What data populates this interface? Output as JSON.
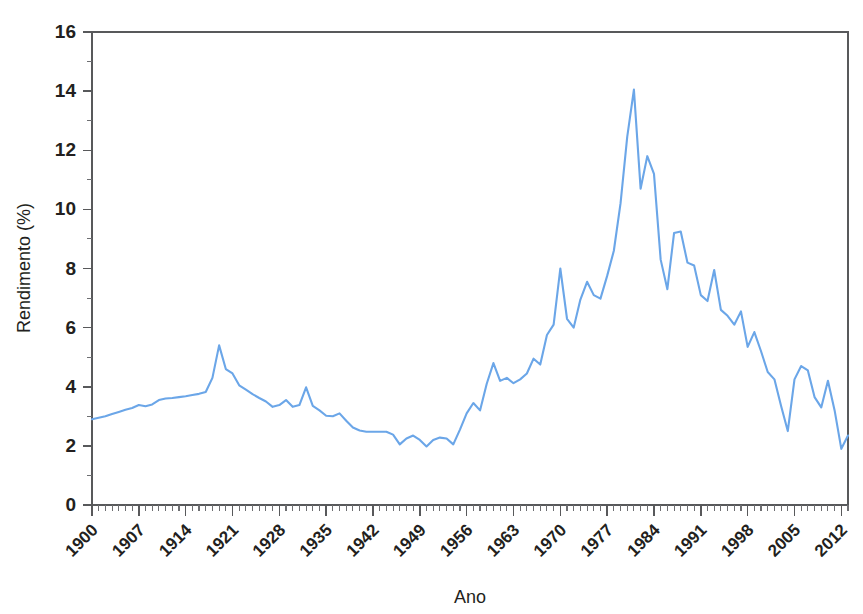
{
  "chart_data": {
    "type": "line",
    "title": "",
    "xlabel": "Ano",
    "ylabel": "Rendimento (%)",
    "xlim": [
      1900,
      2013
    ],
    "ylim": [
      0,
      16
    ],
    "grid": false,
    "legend": false,
    "line_color": "#6ba6e8",
    "axis_color": "#58595b",
    "y_ticks": [
      0,
      2,
      4,
      6,
      8,
      10,
      12,
      14,
      16
    ],
    "y_tick_labels": [
      "0",
      "2",
      "4",
      "6",
      "8",
      "10",
      "12",
      "14",
      "16"
    ],
    "y_minor_step": 1,
    "x_ticks": [
      1900,
      1907,
      1914,
      1921,
      1928,
      1935,
      1942,
      1949,
      1956,
      1963,
      1970,
      1977,
      1984,
      1991,
      1998,
      2005,
      2012
    ],
    "x_tick_labels": [
      "1900",
      "1907",
      "1914",
      "1921",
      "1928",
      "1935",
      "1942",
      "1949",
      "1956",
      "1963",
      "1970",
      "1977",
      "1984",
      "1991",
      "1998",
      "2005",
      "2012"
    ],
    "x_minor_step": 1,
    "x_tick_label_rotation": -45,
    "series": [
      {
        "name": "Rendimento",
        "x": [
          1900,
          1901,
          1902,
          1903,
          1904,
          1905,
          1906,
          1907,
          1908,
          1909,
          1910,
          1911,
          1912,
          1913,
          1914,
          1915,
          1916,
          1917,
          1918,
          1919,
          1920,
          1921,
          1922,
          1923,
          1924,
          1925,
          1926,
          1927,
          1928,
          1929,
          1930,
          1931,
          1932,
          1933,
          1934,
          1935,
          1936,
          1937,
          1938,
          1939,
          1940,
          1941,
          1942,
          1943,
          1944,
          1945,
          1946,
          1947,
          1948,
          1949,
          1950,
          1951,
          1952,
          1953,
          1954,
          1955,
          1956,
          1957,
          1958,
          1959,
          1960,
          1961,
          1962,
          1963,
          1964,
          1965,
          1966,
          1967,
          1968,
          1969,
          1970,
          1971,
          1972,
          1973,
          1974,
          1975,
          1976,
          1977,
          1978,
          1979,
          1980,
          1981,
          1982,
          1983,
          1984,
          1985,
          1986,
          1987,
          1988,
          1989,
          1990,
          1991,
          1992,
          1993,
          1994,
          1995,
          1996,
          1997,
          1998,
          1999,
          2000,
          2001,
          2002,
          2003,
          2004,
          2005,
          2006,
          2007,
          2008,
          2009,
          2010,
          2011,
          2012,
          2013
        ],
        "y": [
          2.9,
          2.95,
          3.0,
          3.08,
          3.15,
          3.22,
          3.28,
          3.38,
          3.34,
          3.4,
          3.55,
          3.6,
          3.62,
          3.65,
          3.68,
          3.72,
          3.76,
          3.82,
          4.3,
          5.4,
          4.6,
          4.45,
          4.05,
          3.9,
          3.75,
          3.62,
          3.5,
          3.32,
          3.38,
          3.55,
          3.32,
          3.38,
          3.98,
          3.35,
          3.2,
          3.02,
          3.0,
          3.1,
          2.85,
          2.62,
          2.52,
          2.48,
          2.48,
          2.48,
          2.48,
          2.38,
          2.05,
          2.25,
          2.35,
          2.2,
          1.98,
          2.2,
          2.28,
          2.25,
          2.05,
          2.55,
          3.1,
          3.45,
          3.2,
          4.1,
          4.8,
          4.2,
          4.3,
          4.12,
          4.25,
          4.45,
          4.95,
          4.75,
          5.75,
          6.1,
          8.0,
          6.3,
          6.0,
          6.95,
          7.55,
          7.1,
          6.98,
          7.75,
          8.6,
          10.2,
          12.45,
          14.05,
          10.7,
          11.8,
          11.2,
          8.3,
          7.3,
          9.2,
          9.25,
          8.2,
          8.1,
          7.1,
          6.9,
          7.95,
          6.6,
          6.4,
          6.1,
          6.55,
          5.35,
          5.85,
          5.2,
          4.5,
          4.25,
          3.35,
          2.5,
          4.25,
          4.7,
          4.55,
          3.65,
          3.3,
          4.2,
          3.2,
          1.9,
          2.35
        ]
      }
    ]
  },
  "axes": {
    "ylabel_text": "Rendimento (%)",
    "xlabel_text": "Ano"
  }
}
